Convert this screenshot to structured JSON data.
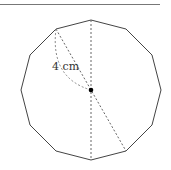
{
  "diagram": {
    "shape": "regular dodecagon",
    "sides": 12,
    "center": [
      91,
      90
    ],
    "radius_px": 70,
    "vertices": [
      [
        91,
        20
      ],
      [
        126,
        29
      ],
      [
        152,
        55
      ],
      [
        161,
        90
      ],
      [
        152,
        125
      ],
      [
        126,
        151
      ],
      [
        91,
        160
      ],
      [
        56,
        151
      ],
      [
        30,
        125
      ],
      [
        21,
        90
      ],
      [
        30,
        55
      ],
      [
        56,
        29
      ]
    ],
    "label": "4 cm",
    "label_position": [
      52,
      70
    ],
    "dashed_segments": [
      {
        "from": [
          91,
          20
        ],
        "to": [
          91,
          160
        ],
        "desc": "vertical diameter"
      },
      {
        "from": [
          56,
          29
        ],
        "to": [
          126,
          151
        ],
        "desc": "diagonal diameter"
      }
    ],
    "radius_marker": {
      "from": [
        56,
        29
      ],
      "to": [
        91,
        90
      ],
      "desc": "curved dashed brace"
    },
    "colors": {
      "outline": "#444444",
      "dashed": "#666666",
      "center_dot": "#000000",
      "rule": "#777777"
    }
  }
}
